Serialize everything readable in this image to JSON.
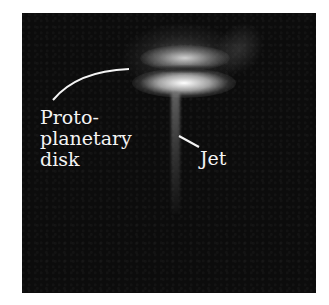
{
  "figure": {
    "labels": {
      "disk_line1": "Proto-",
      "disk_line2": "planetary",
      "disk_line3": "disk",
      "jet": "Jet"
    },
    "colors": {
      "background": "#0c0c0c",
      "label": "#f4f4f4",
      "page": "#ffffff"
    }
  }
}
